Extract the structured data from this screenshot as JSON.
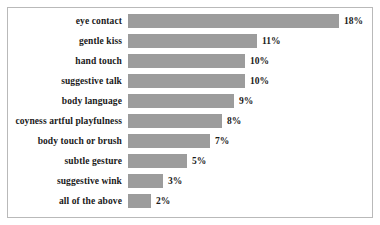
{
  "chart_data": {
    "type": "bar",
    "orientation": "horizontal",
    "title": "",
    "subtitle": "",
    "xlabel": "",
    "ylabel": "",
    "grid": false,
    "legend": null,
    "axis_visible": false,
    "tick_labels": [],
    "xlim": [
      0,
      18
    ],
    "value_suffix": "%",
    "categories": [
      "eye contact",
      "gentle kiss",
      "hand touch",
      "suggestive talk",
      "body language",
      "coyness artful playfulness",
      "body touch or brush",
      "subtle gesture",
      "suggestive wink",
      "all of the above"
    ],
    "values": [
      18,
      11,
      10,
      10,
      9,
      8,
      7,
      5,
      3,
      2
    ],
    "data_labels": [
      "18%",
      "11%",
      "10%",
      "10%",
      "9%",
      "8%",
      "7%",
      "5%",
      "3%",
      "2%"
    ],
    "colors": {
      "bar_fill": "#9c9c9c",
      "frame_border": "#b9b9b9",
      "background": "#ffffff",
      "text": "#1a1a1a"
    }
  }
}
